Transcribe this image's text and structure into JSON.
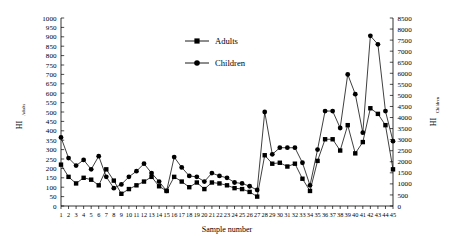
{
  "chart_data": {
    "type": "line",
    "title": "",
    "xlabel": "Sample number",
    "ylabel_left": "HI",
    "ylabel_left_sub": "Adults",
    "ylabel_right": "HI",
    "ylabel_right_sub": "Children",
    "x": [
      1,
      2,
      3,
      4,
      5,
      6,
      7,
      8,
      9,
      10,
      11,
      12,
      13,
      14,
      15,
      16,
      17,
      18,
      19,
      20,
      21,
      22,
      23,
      24,
      25,
      26,
      27,
      28,
      29,
      30,
      31,
      32,
      33,
      34,
      35,
      36,
      37,
      38,
      39,
      40,
      41,
      42,
      43,
      44,
      45
    ],
    "xtick_labels": [
      "1",
      "2",
      "3",
      "4",
      "5",
      "6",
      "7",
      "8",
      "9",
      "10",
      "11",
      "12",
      "13",
      "14",
      "15",
      "16",
      "17",
      "18",
      "19",
      "20",
      "21",
      "22",
      "23",
      "24",
      "25",
      "26",
      "27",
      "28",
      "29",
      "30",
      "31",
      "32",
      "33",
      "34",
      "35",
      "36",
      "37",
      "38",
      "39",
      "40",
      "41",
      "42",
      "43",
      "44",
      "45"
    ],
    "ylim_left": [
      0,
      1000
    ],
    "ylim_right": [
      0,
      8500
    ],
    "ytick_left": [
      0,
      50,
      100,
      150,
      200,
      250,
      300,
      350,
      400,
      450,
      500,
      550,
      600,
      650,
      700,
      750,
      800,
      850,
      900,
      950,
      1000
    ],
    "ytick_right": [
      0,
      500,
      1000,
      1500,
      2000,
      2500,
      3000,
      3500,
      4000,
      4500,
      5000,
      5500,
      6000,
      6500,
      7000,
      7500,
      8000,
      8500
    ],
    "grid": false,
    "legend_position": "top-center",
    "series": [
      {
        "name": "Adults",
        "marker": "square",
        "axis": "left",
        "color": "#000000",
        "values": [
          220,
          155,
          120,
          150,
          140,
          110,
          195,
          135,
          65,
          90,
          110,
          130,
          155,
          105,
          80,
          155,
          130,
          100,
          125,
          90,
          125,
          120,
          110,
          95,
          90,
          75,
          50,
          270,
          225,
          230,
          210,
          225,
          145,
          80,
          240,
          355,
          355,
          295,
          430,
          280,
          340,
          520,
          490,
          430,
          195
        ]
      },
      {
        "name": "Children",
        "marker": "circle",
        "axis": "left",
        "color": "#000000",
        "values": [
          365,
          255,
          215,
          245,
          195,
          265,
          155,
          95,
          115,
          155,
          185,
          225,
          175,
          130,
          80,
          260,
          205,
          160,
          155,
          130,
          175,
          160,
          150,
          125,
          120,
          105,
          85,
          500,
          275,
          310,
          310,
          310,
          230,
          110,
          300,
          505,
          505,
          415,
          700,
          595,
          390,
          905,
          860,
          505,
          345
        ]
      }
    ]
  },
  "legend": {
    "items": [
      {
        "label": "Adults",
        "marker": "square"
      },
      {
        "label": "Children",
        "marker": "circle"
      }
    ]
  }
}
